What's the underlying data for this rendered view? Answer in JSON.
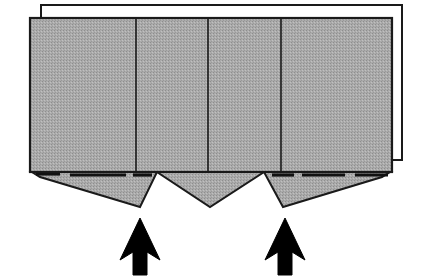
{
  "figure": {
    "title": "Folded carton blank with bottom flaps and force arrows",
    "type": "technical-line-drawing",
    "canvas": {
      "width": 426,
      "height": 278,
      "background": "#ffffff"
    },
    "colors": {
      "panel_fill": "#a8a8a8",
      "panel_fill_light": "#b0b0b0",
      "outline": "#1a1a1a",
      "background": "#ffffff",
      "arrow_fill": "#000000",
      "fold_line": "#111111"
    },
    "back_sheet": {
      "label": "back-sheet",
      "fill": "#ffffff",
      "stroke": "#1a1a1a",
      "stroke_width": 2,
      "points": "41,5 402,5 402,160 392,160 392,18 41,18"
    },
    "front_panel": {
      "label": "front-panel-body",
      "fill": "#a8a8a8",
      "stroke": "#1a1a1a",
      "stroke_width": 2,
      "x": 30,
      "y": 18,
      "width": 362,
      "height": 154
    },
    "score_lines": [
      {
        "label": "score-line-1",
        "x": 136,
        "y1": 18,
        "y2": 172
      },
      {
        "label": "score-line-2",
        "x": 208,
        "y1": 18,
        "y2": 172
      },
      {
        "label": "score-line-3",
        "x": 281,
        "y1": 18,
        "y2": 172
      }
    ],
    "fold_dashes": [
      {
        "label": "fold-dash-a",
        "x1": 36,
        "y1": 174,
        "x2": 60,
        "y2": 174
      },
      {
        "label": "fold-dash-b",
        "x1": 70,
        "y1": 175,
        "x2": 126,
        "y2": 175
      },
      {
        "label": "fold-dash-c",
        "x1": 133,
        "y1": 175,
        "x2": 152,
        "y2": 175
      },
      {
        "label": "fold-dash-d",
        "x1": 272,
        "y1": 175,
        "x2": 294,
        "y2": 175
      },
      {
        "label": "fold-dash-e",
        "x1": 302,
        "y1": 175,
        "x2": 345,
        "y2": 175
      },
      {
        "label": "fold-dash-f",
        "x1": 355,
        "y1": 175,
        "x2": 388,
        "y2": 175
      }
    ],
    "flaps": [
      {
        "label": "flap-left",
        "fill": "#a8a8a8",
        "stroke": "#1a1a1a",
        "points": "32,172 157,172 140,207 40,177"
      },
      {
        "label": "flap-center",
        "fill": "#a8a8a8",
        "stroke": "#1a1a1a",
        "points": "157,172 264,172 210,207"
      },
      {
        "label": "flap-right",
        "fill": "#a8a8a8",
        "stroke": "#1a1a1a",
        "points": "264,172 390,172 382,177 283,207"
      }
    ],
    "notches": [
      {
        "label": "notch-left",
        "apex_x": 157,
        "apex_y": 172
      },
      {
        "label": "notch-right",
        "apex_x": 264,
        "apex_y": 172
      }
    ],
    "arrows": [
      {
        "label": "arrow-left",
        "direction": "up",
        "fill": "#000000",
        "tip_x": 140,
        "tip_y": 218,
        "base_y": 275,
        "points": "140,218 160,260 147,252 147,275 133,275 133,252 120,260"
      },
      {
        "label": "arrow-right",
        "direction": "up",
        "fill": "#000000",
        "tip_x": 285,
        "tip_y": 218,
        "base_y": 275,
        "points": "285,218 305,260 292,252 292,275 278,275 278,252 265,260"
      }
    ]
  }
}
